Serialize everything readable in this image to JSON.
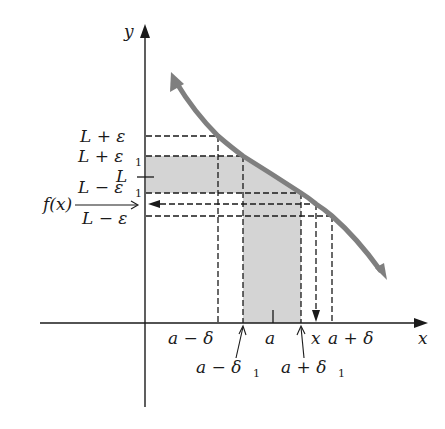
{
  "axes": {
    "x_label": "x",
    "y_label": "y"
  },
  "y_labels": {
    "L_plus_eps": "L + ε",
    "L_plus_eps1": "L + ε",
    "L": "L",
    "L_minus_eps1": "L − ε",
    "fx": "f(x)",
    "L_minus_eps": "L − ε",
    "sub1": "1"
  },
  "x_labels": {
    "a_minus_delta": "a − δ",
    "a_minus_delta1": "a − δ",
    "a": "a",
    "a_plus_delta1": "a + δ",
    "x": "x",
    "a_plus_delta": "a + δ",
    "sub1": "1"
  },
  "colors": {
    "curve": "#7f7f7f",
    "shade": "#d4d4d4",
    "ink": "#1a1a1a"
  }
}
